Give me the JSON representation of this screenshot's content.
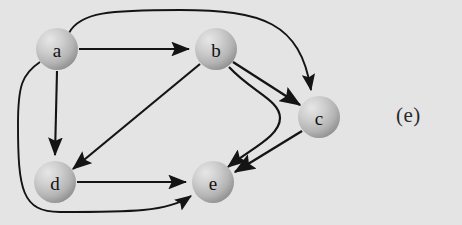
{
  "figure": {
    "caption": "(e)",
    "background_color": "#e4e4e4",
    "edge_color": "#141414",
    "node_fill_light": "#d8d8d8",
    "node_fill_mid": "#bdbdbd",
    "node_fill_dark": "#9a9a9a",
    "node_label_color": "#111111",
    "type": "directed-graph"
  },
  "graph": {
    "nodes": [
      {
        "id": "a",
        "label": "a",
        "cx": 57,
        "cy": 49,
        "r": 21
      },
      {
        "id": "b",
        "label": "b",
        "cx": 216,
        "cy": 49,
        "r": 21
      },
      {
        "id": "c",
        "label": "c",
        "cx": 319,
        "cy": 117,
        "r": 21
      },
      {
        "id": "d",
        "label": "d",
        "cx": 55,
        "cy": 182,
        "r": 21
      },
      {
        "id": "e",
        "label": "e",
        "cx": 213,
        "cy": 182,
        "r": 21
      }
    ],
    "edges": [
      {
        "id": "a-b",
        "from": "a",
        "to": "b",
        "shape": "straight"
      },
      {
        "id": "a-d",
        "from": "a",
        "to": "d",
        "shape": "straight"
      },
      {
        "id": "a-c",
        "from": "a",
        "to": "c",
        "shape": "curved-over-top"
      },
      {
        "id": "a-e",
        "from": "a",
        "to": "e",
        "shape": "curved-around-bottom-left"
      },
      {
        "id": "b-c",
        "from": "b",
        "to": "c",
        "shape": "straight"
      },
      {
        "id": "b-d",
        "from": "b",
        "to": "d",
        "shape": "straight"
      },
      {
        "id": "b-e",
        "from": "b",
        "to": "e",
        "shape": "curved-s-bend"
      },
      {
        "id": "c-e",
        "from": "c",
        "to": "e",
        "shape": "straight"
      },
      {
        "id": "d-e",
        "from": "d",
        "to": "e",
        "shape": "straight"
      }
    ]
  }
}
